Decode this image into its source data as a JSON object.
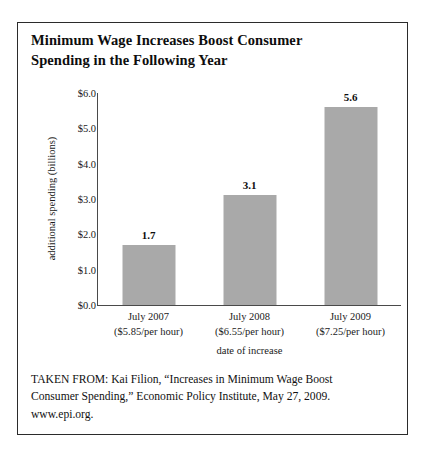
{
  "figure": {
    "title_line1": "Minimum Wage Increases Boost Consumer",
    "title_line2": "Spending in the Following Year",
    "source_line1": "TAKEN FROM: Kai Filion, “Increases in Minimum Wage Boost",
    "source_line2": "Consumer Spending,” Economic Policy Institute, May 27, 2009.",
    "source_line3": "www.epi.org."
  },
  "chart_data": {
    "type": "bar",
    "title": "Minimum Wage Increases Boost Consumer Spending in the Following Year",
    "xlabel": "date of increase",
    "ylabel": "additional spending (billions)",
    "categories": [
      "July 2007",
      "July 2008",
      "July 2009"
    ],
    "category_sublabels": [
      "($5.85/per hour)",
      "($6.55/per hour)",
      "($7.25/per hour)"
    ],
    "values": [
      1.7,
      3.1,
      5.6
    ],
    "value_labels": [
      "1.7",
      "3.1",
      "5.6"
    ],
    "ylim": [
      0.0,
      6.0
    ],
    "ytick_values": [
      0.0,
      1.0,
      2.0,
      3.0,
      4.0,
      5.0,
      6.0
    ],
    "ytick_labels": [
      "$0.0",
      "$1.0",
      "$2.0",
      "$3.0",
      "$4.0",
      "$5.0",
      "$6.0"
    ],
    "grid": false,
    "legend": "none",
    "bar_color": "#a9a9a9",
    "axis_color": "#4a4a4a",
    "border_color": "#2b2b2b"
  }
}
